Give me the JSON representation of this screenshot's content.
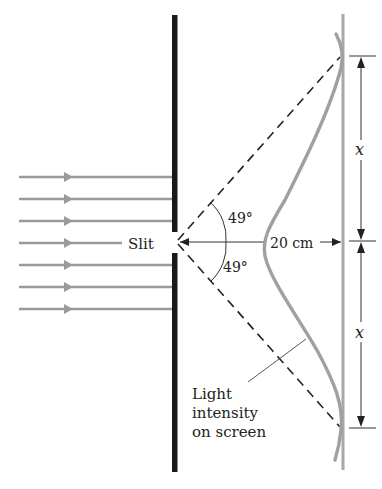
{
  "figure": {
    "type": "single-slit diffraction diagram",
    "labels": {
      "slit": "Slit",
      "angle_top": "49°",
      "angle_bottom": "49°",
      "distance": "20 cm",
      "x_top": "x",
      "x_bottom": "x",
      "intensity_line1": "Light",
      "intensity_line2": "intensity",
      "intensity_line3": "on screen"
    },
    "incoming_rays": 7,
    "colors": {
      "barrier": "#1a1a1a",
      "rays": "#9a9a9a",
      "intensity_curve": "#a0a0a0",
      "screen": "#a8a8a8",
      "lines": "#333333"
    }
  }
}
